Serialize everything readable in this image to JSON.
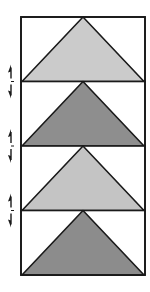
{
  "diagram": {
    "title": "",
    "frame": {
      "x": 21,
      "y": 17,
      "width": 124,
      "segment_height": 64.5,
      "stroke": "#1a1a1a"
    },
    "segments": [
      {
        "index": 0,
        "fill": "#cbcbcb",
        "shade": "light"
      },
      {
        "index": 1,
        "fill": "#8e8e8e",
        "shade": "dark"
      },
      {
        "index": 2,
        "fill": "#c4c4c4",
        "shade": "light"
      },
      {
        "index": 3,
        "fill": "#8c8c8c",
        "shade": "dark"
      }
    ],
    "arrows": [
      {
        "at_joint": 1,
        "type": "double-vertical-arrow"
      },
      {
        "at_joint": 2,
        "type": "double-vertical-arrow"
      },
      {
        "at_joint": 3,
        "type": "double-vertical-arrow"
      }
    ],
    "colors": {
      "stroke": "#1a1a1a",
      "background": "#ffffff"
    }
  }
}
